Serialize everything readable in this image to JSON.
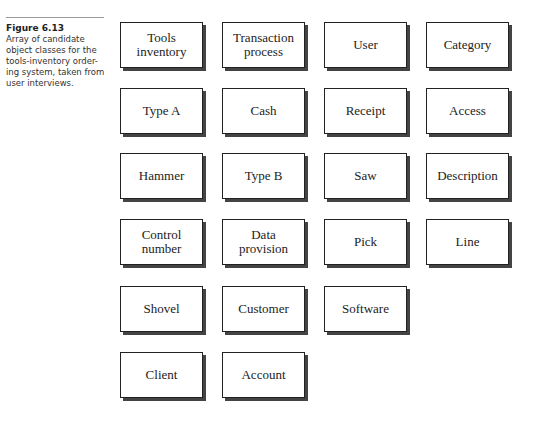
{
  "caption": {
    "label": "Figure 6.13",
    "text": "Array of candidate object classes for the tools-inventory order-ing system, taken from user interviews."
  },
  "boxes": [
    {
      "label": "Tools\ninventory",
      "row": 0,
      "col": 0
    },
    {
      "label": "Transaction\nprocess",
      "row": 0,
      "col": 1
    },
    {
      "label": "User",
      "row": 0,
      "col": 2
    },
    {
      "label": "Category",
      "row": 0,
      "col": 3
    },
    {
      "label": "Type A",
      "row": 1,
      "col": 0
    },
    {
      "label": "Cash",
      "row": 1,
      "col": 1
    },
    {
      "label": "Receipt",
      "row": 1,
      "col": 2
    },
    {
      "label": "Access",
      "row": 1,
      "col": 3
    },
    {
      "label": "Hammer",
      "row": 2,
      "col": 0
    },
    {
      "label": "Type B",
      "row": 2,
      "col": 1
    },
    {
      "label": "Saw",
      "row": 2,
      "col": 2
    },
    {
      "label": "Description",
      "row": 2,
      "col": 3
    },
    {
      "label": "Control\nnumber",
      "row": 3,
      "col": 0
    },
    {
      "label": "Data\nprovision",
      "row": 3,
      "col": 1
    },
    {
      "label": "Pick",
      "row": 3,
      "col": 2
    },
    {
      "label": "Line",
      "row": 3,
      "col": 3
    },
    {
      "label": "Shovel",
      "row": 4,
      "col": 0
    },
    {
      "label": "Customer",
      "row": 4,
      "col": 1
    },
    {
      "label": "Software",
      "row": 4,
      "col": 2
    },
    {
      "label": "Client",
      "row": 5,
      "col": 0
    },
    {
      "label": "Account",
      "row": 5,
      "col": 1
    }
  ]
}
